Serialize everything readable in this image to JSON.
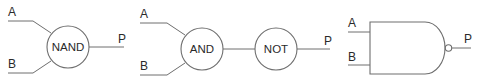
{
  "diagrams": [
    {
      "name": "nand-block",
      "inputs": [
        "A",
        "B"
      ],
      "gates": [
        "NAND"
      ],
      "output": "P"
    },
    {
      "name": "and-not-block",
      "inputs": [
        "A",
        "B"
      ],
      "gates": [
        "AND",
        "NOT"
      ],
      "output": "P"
    },
    {
      "name": "nand-symbol",
      "inputs": [
        "A",
        "B"
      ],
      "gates": [],
      "output": "P"
    }
  ],
  "colors": {
    "line": "#6e6e6e",
    "text": "#2a2a2a",
    "background": "#ffffff"
  }
}
